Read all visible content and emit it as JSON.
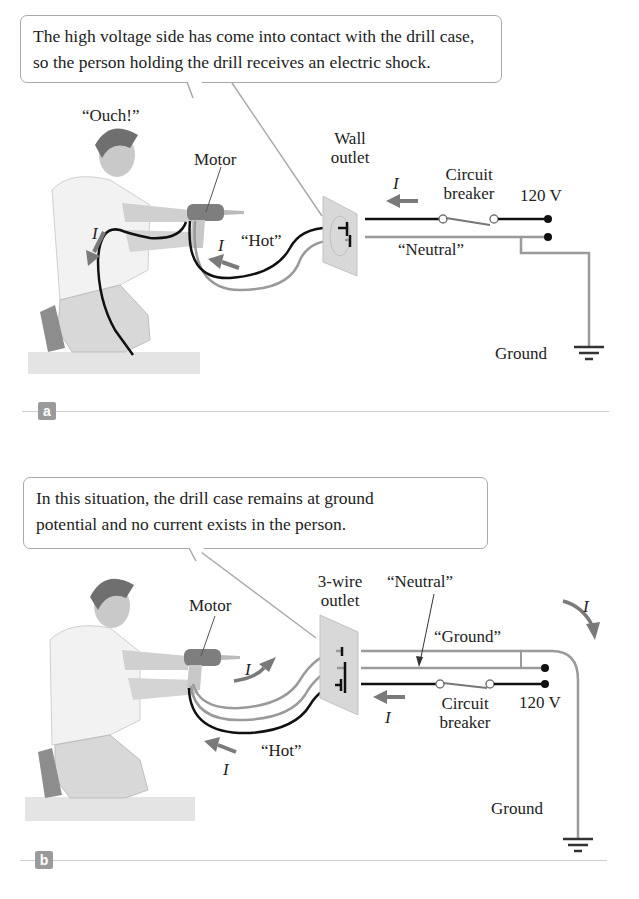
{
  "panels": [
    {
      "id": "a",
      "tag": "a",
      "callout_text": "The high voltage side has come into contact with the drill case, so the person holding the drill  receives an electric shock.",
      "callout_line1": "The high voltage side has come into contact with the drill case,",
      "callout_line2": "so the person holding the drill  receives an electric shock.",
      "labels": {
        "exclaim": "“Ouch!”",
        "motor": "Motor",
        "outlet_line1": "Wall",
        "outlet_line2": "outlet",
        "breaker_line1": "Circuit",
        "breaker_line2": "breaker",
        "voltage": "120 V",
        "hot": "“Hot”",
        "neutral": "“Neutral”",
        "ground": "Ground",
        "current_symbol": "I"
      }
    },
    {
      "id": "b",
      "tag": "b",
      "callout_line1": "In this situation, the drill case remains at ground",
      "callout_line2": "potential and no current exists in the person.",
      "labels": {
        "motor": "Motor",
        "outlet_line1": "3-wire",
        "outlet_line2": "outlet",
        "neutral": "“Neutral”",
        "ground_wire": "“Ground”",
        "breaker_line1": "Circuit",
        "breaker_line2": "breaker",
        "voltage": "120 V",
        "hot": "“Hot”",
        "ground": "Ground",
        "current_symbol": "I"
      }
    }
  ],
  "colors": {
    "hot_wire": "#111111",
    "neutral_wire": "#9a9a9a",
    "arrow": "#7a7a7a",
    "outlet_plate": "#d4d4d4",
    "callout_border": "#a9a9a9"
  }
}
